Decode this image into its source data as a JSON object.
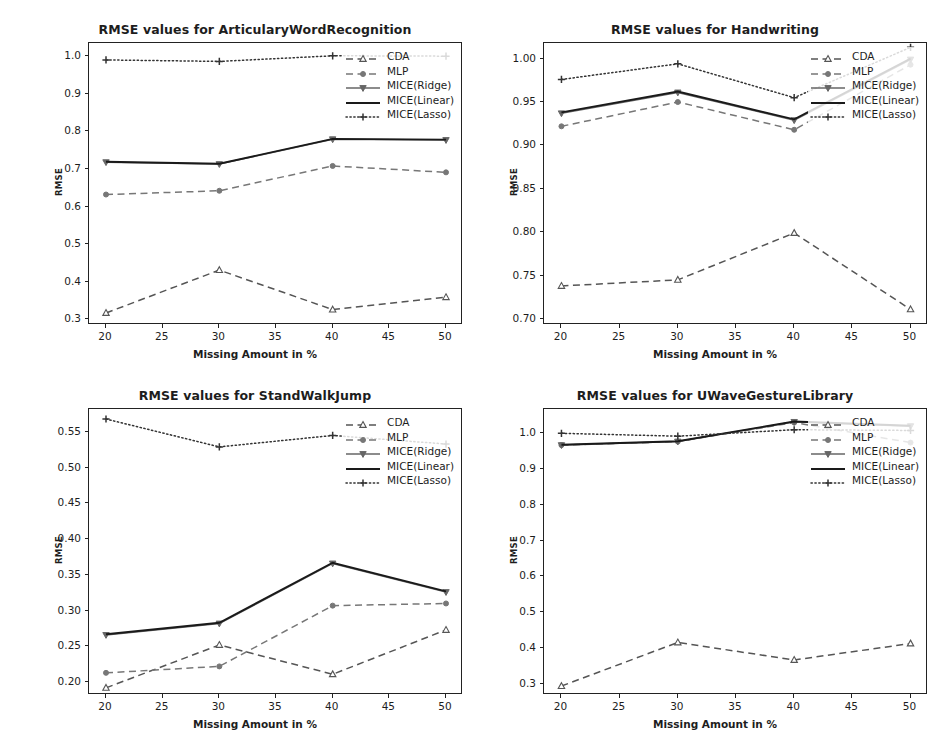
{
  "figure": {
    "width": 945,
    "height": 754,
    "background": "#ffffff",
    "series_names": [
      "CDA",
      "MLP",
      "MICE(Ridge)",
      "MICE(Linear)",
      "MICE(Lasso)"
    ],
    "xlabel": "Missing Amount in %",
    "ylabel": "RMSE"
  },
  "chart_data": [
    {
      "type": "line",
      "title": "RMSE values for ArticularyWordRecognition",
      "xlabel": "Missing Amount in %",
      "ylabel": "RMSE",
      "x": [
        20,
        30,
        40,
        50
      ],
      "xticks": [
        20,
        25,
        30,
        35,
        40,
        45,
        50
      ],
      "xlim": [
        18.5,
        51.5
      ],
      "yticks": [
        0.3,
        0.4,
        0.5,
        0.6,
        0.7,
        0.8,
        0.9,
        1.0
      ],
      "ytick_labels": [
        "0.3",
        "0.4",
        "0.5",
        "0.6",
        "0.7",
        "0.8",
        "0.9",
        "1.0"
      ],
      "ylim": [
        0.285,
        1.035
      ],
      "grid": false,
      "legend_position": "upper right",
      "series": [
        {
          "name": "CDA",
          "values": [
            0.317,
            0.431,
            0.326,
            0.359
          ],
          "style": "dashed",
          "marker": "triangle-up",
          "color": "#555555"
        },
        {
          "name": "MLP",
          "values": [
            0.632,
            0.642,
            0.708,
            0.691
          ],
          "style": "dashed",
          "marker": "circle",
          "color": "#777777"
        },
        {
          "name": "MICE(Ridge)",
          "values": [
            0.718,
            0.713,
            0.779,
            0.777
          ],
          "style": "solid",
          "marker": "triangle-down",
          "color": "#666666"
        },
        {
          "name": "MICE(Linear)",
          "values": [
            0.719,
            0.714,
            0.78,
            0.778
          ],
          "style": "solid",
          "marker": "none",
          "color": "#1a1a1a"
        },
        {
          "name": "MICE(Lasso)",
          "values": [
            0.99,
            0.986,
            1.001,
            1.0
          ],
          "style": "dotted",
          "marker": "plus",
          "color": "#333333"
        }
      ]
    },
    {
      "type": "line",
      "title": "RMSE values for Handwriting",
      "xlabel": "Missing Amount in %",
      "ylabel": "RMSE",
      "x": [
        20,
        30,
        40,
        50
      ],
      "xticks": [
        20,
        25,
        30,
        35,
        40,
        45,
        50
      ],
      "xlim": [
        18.5,
        51.5
      ],
      "yticks": [
        0.7,
        0.75,
        0.8,
        0.85,
        0.9,
        0.95,
        1.0
      ],
      "ytick_labels": [
        "0.70",
        "0.75",
        "0.80",
        "0.85",
        "0.90",
        "0.95",
        "1.00"
      ],
      "ylim": [
        0.693,
        1.018
      ],
      "grid": false,
      "legend_position": "upper right",
      "series": [
        {
          "name": "CDA",
          "values": [
            0.738,
            0.745,
            0.799,
            0.711
          ],
          "style": "dashed",
          "marker": "triangle-up",
          "color": "#555555"
        },
        {
          "name": "MLP",
          "values": [
            0.922,
            0.95,
            0.918,
            0.993
          ],
          "style": "dashed",
          "marker": "circle",
          "color": "#777777"
        },
        {
          "name": "MICE(Ridge)",
          "values": [
            0.937,
            0.961,
            0.929,
            0.999
          ],
          "style": "solid",
          "marker": "triangle-down",
          "color": "#666666"
        },
        {
          "name": "MICE(Linear)",
          "values": [
            0.938,
            0.962,
            0.93,
            1.0
          ],
          "style": "solid",
          "marker": "none",
          "color": "#1a1a1a"
        },
        {
          "name": "MICE(Lasso)",
          "values": [
            0.976,
            0.994,
            0.955,
            1.013
          ],
          "style": "dotted",
          "marker": "plus",
          "color": "#333333"
        }
      ]
    },
    {
      "type": "line",
      "title": "RMSE values for StandWalkJump",
      "xlabel": "Missing Amount in %",
      "ylabel": "RMSE",
      "x": [
        20,
        30,
        40,
        50
      ],
      "xticks": [
        20,
        25,
        30,
        35,
        40,
        45,
        50
      ],
      "xlim": [
        18.5,
        51.5
      ],
      "yticks": [
        0.2,
        0.25,
        0.3,
        0.35,
        0.4,
        0.45,
        0.5,
        0.55
      ],
      "ytick_labels": [
        "0.20",
        "0.25",
        "0.30",
        "0.35",
        "0.40",
        "0.45",
        "0.50",
        "0.55"
      ],
      "ylim": [
        0.182,
        0.582
      ],
      "grid": false,
      "legend_position": "upper right",
      "series": [
        {
          "name": "CDA",
          "values": [
            0.192,
            0.252,
            0.211,
            0.273
          ],
          "style": "dashed",
          "marker": "triangle-up",
          "color": "#555555"
        },
        {
          "name": "MLP",
          "values": [
            0.213,
            0.222,
            0.307,
            0.31
          ],
          "style": "dashed",
          "marker": "circle",
          "color": "#777777"
        },
        {
          "name": "MICE(Ridge)",
          "values": [
            0.266,
            0.282,
            0.366,
            0.326
          ],
          "style": "solid",
          "marker": "triangle-down",
          "color": "#666666"
        },
        {
          "name": "MICE(Linear)",
          "values": [
            0.267,
            0.283,
            0.367,
            0.327
          ],
          "style": "solid",
          "marker": "none",
          "color": "#1a1a1a"
        },
        {
          "name": "MICE(Lasso)",
          "values": [
            0.568,
            0.529,
            0.545,
            0.533
          ],
          "style": "dotted",
          "marker": "plus",
          "color": "#333333"
        }
      ]
    },
    {
      "type": "line",
      "title": "RMSE values for UWaveGestureLibrary",
      "xlabel": "Missing Amount in %",
      "ylabel": "RMSE",
      "x": [
        20,
        30,
        40,
        50
      ],
      "xticks": [
        20,
        25,
        30,
        35,
        40,
        45,
        50
      ],
      "xlim": [
        18.5,
        51.5
      ],
      "yticks": [
        0.3,
        0.4,
        0.5,
        0.6,
        0.7,
        0.8,
        0.9,
        1.0
      ],
      "ytick_labels": [
        "0.3",
        "0.4",
        "0.5",
        "0.6",
        "0.7",
        "0.8",
        "0.9",
        "1.0"
      ],
      "ylim": [
        0.268,
        1.068
      ],
      "grid": false,
      "legend_position": "upper right",
      "series": [
        {
          "name": "CDA",
          "values": [
            0.293,
            0.415,
            0.366,
            0.412
          ],
          "style": "dashed",
          "marker": "triangle-up",
          "color": "#555555"
        },
        {
          "name": "MLP",
          "values": [
            0.967,
            0.977,
            1.03,
            0.974
          ],
          "style": "dashed",
          "marker": "circle",
          "color": "#777777"
        },
        {
          "name": "MICE(Ridge)",
          "values": [
            0.967,
            0.977,
            1.032,
            1.02
          ],
          "style": "solid",
          "marker": "triangle-down",
          "color": "#666666"
        },
        {
          "name": "MICE(Linear)",
          "values": [
            0.968,
            0.978,
            1.033,
            1.021
          ],
          "style": "solid",
          "marker": "none",
          "color": "#1a1a1a"
        },
        {
          "name": "MICE(Lasso)",
          "values": [
            1.0,
            0.992,
            1.01,
            1.008
          ],
          "style": "dotted",
          "marker": "plus",
          "color": "#333333"
        }
      ]
    }
  ],
  "panels": [
    {
      "id": "articulary",
      "left": 40,
      "top": 22,
      "width": 430,
      "height": 348
    },
    {
      "id": "handwriting",
      "left": 495,
      "top": 22,
      "width": 440,
      "height": 348
    },
    {
      "id": "standwalkjump",
      "left": 40,
      "top": 388,
      "width": 430,
      "height": 352
    },
    {
      "id": "uwave",
      "left": 495,
      "top": 388,
      "width": 440,
      "height": 352
    }
  ]
}
